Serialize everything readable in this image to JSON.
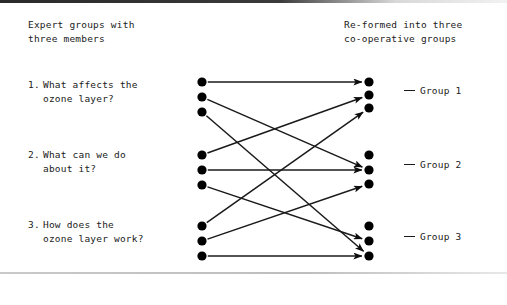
{
  "figure": {
    "type": "jigsaw-grouping-diagram",
    "headers": {
      "left": "Expert groups with\nthree members",
      "right": "Re-formed into three\nco-operative groups"
    },
    "expert_groups": [
      {
        "number": "1.",
        "text": "What affects the\nozone layer?"
      },
      {
        "number": "2.",
        "text": "What can we do\nabout it?"
      },
      {
        "number": "3.",
        "text": "How does the\nozone layer work?"
      }
    ],
    "cooperative_groups": [
      {
        "label": "Group 1"
      },
      {
        "label": "Group 2"
      },
      {
        "label": "Group 3"
      }
    ],
    "colors": {
      "ink": "#1a1a1a",
      "node": "#000000",
      "paper": "#ffffff"
    },
    "nodes": {
      "left_x": 202,
      "right_x": 369,
      "radius": 4.6,
      "left_y": [
        82,
        97,
        112,
        155,
        170,
        185,
        226,
        241,
        256
      ],
      "right_y": [
        82,
        95,
        108,
        155,
        170,
        184,
        226,
        241,
        256
      ]
    },
    "edges": [
      {
        "from": 0,
        "to": 0
      },
      {
        "from": 1,
        "to": 4
      },
      {
        "from": 2,
        "to": 8
      },
      {
        "from": 3,
        "to": 1
      },
      {
        "from": 4,
        "to": 4
      },
      {
        "from": 5,
        "to": 7
      },
      {
        "from": 6,
        "to": 2
      },
      {
        "from": 7,
        "to": 5
      },
      {
        "from": 8,
        "to": 8
      }
    ]
  }
}
